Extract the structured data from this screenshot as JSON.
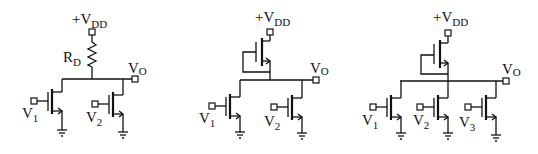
{
  "diagram": {
    "type": "circuit-schematic",
    "circuits": [
      {
        "id": "circuit-1",
        "load": "resistor",
        "supply_label": "+V",
        "supply_sub": "DD",
        "load_label": "R",
        "load_sub": "D",
        "output_label": "V",
        "output_sub": "O",
        "inputs": [
          {
            "label": "V",
            "sub": "1"
          },
          {
            "label": "V",
            "sub": "2"
          }
        ]
      },
      {
        "id": "circuit-2",
        "load": "nmos-diode-connected",
        "supply_label": "+V",
        "supply_sub": "DD",
        "output_label": "V",
        "output_sub": "O",
        "inputs": [
          {
            "label": "V",
            "sub": "1"
          },
          {
            "label": "V",
            "sub": "2"
          }
        ]
      },
      {
        "id": "circuit-3",
        "load": "nmos-diode-connected",
        "supply_label": "+V",
        "supply_sub": "DD",
        "output_label": "V",
        "output_sub": "O",
        "inputs": [
          {
            "label": "V",
            "sub": "1"
          },
          {
            "label": "V",
            "sub": "2"
          },
          {
            "label": "V",
            "sub": "3"
          }
        ]
      }
    ]
  }
}
